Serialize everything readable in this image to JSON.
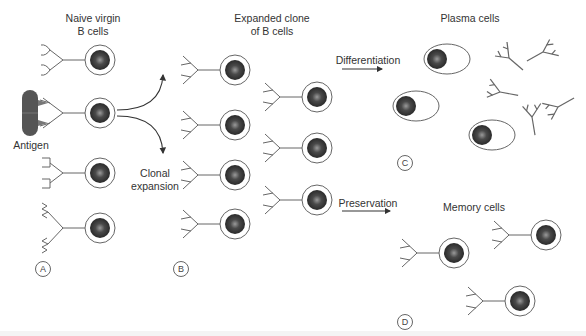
{
  "diagram": {
    "columns": [
      {
        "id": "A",
        "title_line1": "Naive virgin",
        "title_line2": "B cells"
      },
      {
        "id": "B",
        "title_line1": "Expanded clone",
        "title_line2": "of B cells"
      },
      {
        "id": "C",
        "title": "Plasma cells"
      },
      {
        "id": "D",
        "title": "Memory cells"
      }
    ],
    "labels": {
      "antigen": "Antigen",
      "clonal_line1": "Clonal",
      "clonal_line2": "expansion",
      "differentiation": "Differentiation",
      "preservation": "Preservation"
    },
    "panel_tags": [
      "A",
      "B",
      "C",
      "D"
    ],
    "colors": {
      "line": "#666666",
      "nucleus": "#3a3a3a",
      "antigen": "#555555",
      "text": "#333333"
    }
  }
}
